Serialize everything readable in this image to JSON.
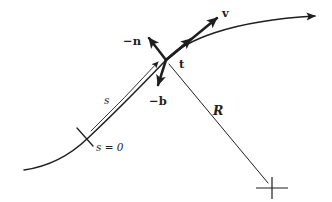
{
  "figure": {
    "background_color": "#ffffff",
    "ink_color": "#1f1f1f",
    "labels": {
      "velocity": "v",
      "tangent": "t",
      "negative_normal": "−n",
      "negative_binormal": "−b",
      "radius_of_curvature": "R",
      "arc_length": "s",
      "arc_length_origin": "s = 0"
    }
  }
}
